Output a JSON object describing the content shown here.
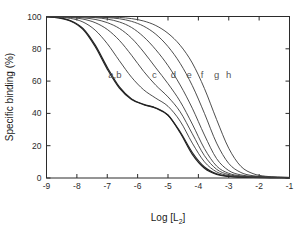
{
  "chart_data": {
    "type": "line",
    "title": "",
    "subtitle": "",
    "xlabel": "Log [L",
    "xlabel_sub": "2",
    "xlabel_tail": "]",
    "xlabel_full": "Log [L2]",
    "ylabel": "Specific binding (%)",
    "xlim": [
      -9,
      -1
    ],
    "ylim": [
      0,
      100
    ],
    "grid": false,
    "legend_position": "inline-curve-labels",
    "xticks": [
      -9,
      -8,
      -7,
      -6,
      -5,
      -4,
      -3,
      -2,
      -1
    ],
    "xticklabels": [
      "-9",
      "-8",
      "-7",
      "-6",
      "-5",
      "-4",
      "-3",
      "-2",
      "-1"
    ],
    "yticks": [
      0,
      20,
      40,
      60,
      80,
      100
    ],
    "yticklabels": [
      "0",
      "20",
      "40",
      "60",
      "80",
      "100"
    ],
    "x": [
      -9.0,
      -8.6,
      -8.2,
      -7.8,
      -7.4,
      -7.0,
      -6.6,
      -6.2,
      -5.8,
      -5.4,
      -5.0,
      -4.6,
      -4.2,
      -3.8,
      -3.4,
      -3.0,
      -2.6,
      -2.2,
      -1.8,
      -1.4,
      -1.0
    ],
    "series": [
      {
        "name": "a",
        "label": "a",
        "label_x": -6.9,
        "label_y": 62,
        "values": [
          99.8,
          99.2,
          97.4,
          92.6,
          82.4,
          68.6,
          56.4,
          49.0,
          45.6,
          43.4,
          39.0,
          28.0,
          14.6,
          6.0,
          2.2,
          0.9,
          0.5,
          0.3,
          0.2,
          0.2,
          0.1
        ]
      },
      {
        "name": "b",
        "label": "b",
        "label_x": -6.6,
        "label_y": 62,
        "values": [
          99.8,
          99.1,
          97.1,
          92.0,
          81.4,
          67.4,
          55.6,
          48.6,
          45.4,
          43.2,
          38.8,
          28.6,
          15.8,
          6.8,
          2.6,
          1.1,
          0.6,
          0.4,
          0.3,
          0.2,
          0.2
        ]
      },
      {
        "name": "c",
        "label": "c",
        "label_x": -5.45,
        "label_y": 62,
        "values": [
          99.9,
          99.6,
          98.8,
          96.6,
          91.6,
          83.2,
          72.6,
          62.4,
          54.6,
          49.4,
          44.4,
          35.2,
          21.6,
          10.0,
          3.8,
          1.5,
          0.8,
          0.5,
          0.3,
          0.3,
          0.2
        ]
      },
      {
        "name": "d",
        "label": "d",
        "label_x": -4.82,
        "label_y": 62,
        "values": [
          99.9,
          99.8,
          99.4,
          98.4,
          96.2,
          92.0,
          85.2,
          76.0,
          66.0,
          57.4,
          50.2,
          41.0,
          27.4,
          13.8,
          5.4,
          2.1,
          1.0,
          0.6,
          0.4,
          0.3,
          0.2
        ]
      },
      {
        "name": "e",
        "label": "e",
        "label_x": -4.3,
        "label_y": 62,
        "values": [
          100.0,
          99.9,
          99.7,
          99.2,
          98.2,
          96.2,
          92.6,
          86.6,
          78.0,
          68.2,
          58.4,
          47.4,
          33.4,
          18.2,
          7.4,
          2.9,
          1.3,
          0.7,
          0.5,
          0.3,
          0.3
        ]
      },
      {
        "name": "f",
        "label": "f",
        "label_x": -3.88,
        "label_y": 62,
        "values": [
          100.0,
          100.0,
          99.9,
          99.7,
          99.3,
          98.4,
          96.6,
          93.2,
          87.4,
          79.4,
          69.6,
          57.6,
          43.2,
          26.6,
          12.0,
          4.6,
          1.9,
          1.0,
          0.6,
          0.4,
          0.3
        ]
      },
      {
        "name": "g",
        "label": "g",
        "label_x": -3.4,
        "label_y": 62,
        "values": [
          100.0,
          100.0,
          100.0,
          99.9,
          99.7,
          99.3,
          98.6,
          97.0,
          94.0,
          89.0,
          81.4,
          71.0,
          57.2,
          40.0,
          21.6,
          9.0,
          3.4,
          1.4,
          0.8,
          0.5,
          0.3
        ]
      },
      {
        "name": "h",
        "label": "h",
        "label_x": -3.0,
        "label_y": 62,
        "values": [
          100.0,
          100.0,
          100.0,
          100.0,
          99.9,
          99.7,
          99.4,
          98.7,
          97.2,
          94.4,
          89.6,
          82.2,
          71.2,
          55.4,
          36.2,
          18.4,
          7.2,
          2.7,
          1.1,
          0.6,
          0.4
        ]
      }
    ],
    "annotations": [
      {
        "text": "a,b",
        "x": -6.75,
        "y": 62
      },
      {
        "text": "c",
        "x": -5.45,
        "y": 62
      },
      {
        "text": "d",
        "x": -4.82,
        "y": 62
      },
      {
        "text": "e",
        "x": -4.3,
        "y": 62
      },
      {
        "text": "f",
        "x": -3.88,
        "y": 62
      },
      {
        "text": "g",
        "x": -3.4,
        "y": 62
      },
      {
        "text": "h",
        "x": -3.0,
        "y": 62
      }
    ],
    "colors": {
      "axis": "#2b2b2b",
      "curve": "#3a3a3a",
      "curve_heavy": "#222222",
      "label": "#555555",
      "background": "#ffffff"
    }
  }
}
